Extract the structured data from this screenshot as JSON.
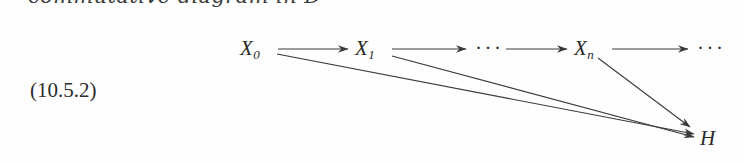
{
  "page": {
    "width": 744,
    "height": 163,
    "background": "#fefefe",
    "ink_color": "#2b2b2b"
  },
  "caption": {
    "text": "commutative diagram in D",
    "style": "italic",
    "note": "clipped by top edge of screenshot"
  },
  "equation": {
    "tag": "(10.5.2)"
  },
  "diagram": {
    "nodes": [
      {
        "id": "x0",
        "base": "X",
        "sub": "0",
        "x": 240,
        "y": 36
      },
      {
        "id": "x1",
        "base": "X",
        "sub": "1",
        "x": 355,
        "y": 36
      },
      {
        "id": "xn",
        "base": "X",
        "sub": "n",
        "x": 574,
        "y": 36
      },
      {
        "id": "h",
        "base": "H",
        "sub": "",
        "x": 700,
        "y": 126
      }
    ],
    "ellipses": [
      {
        "id": "mid-ellipsis",
        "text": "···",
        "x": 475,
        "y": 36
      },
      {
        "id": "tail-ellipsis",
        "text": "···",
        "x": 697,
        "y": 36
      }
    ],
    "horizontal_arrows": [
      {
        "from": "x0",
        "to": "x1",
        "x1": 278,
        "x2": 348,
        "y": 49
      },
      {
        "from": "x1",
        "to": "mid-ellipsis",
        "x1": 392,
        "x2": 466,
        "y": 49
      },
      {
        "from": "mid-ellipsis",
        "to": "xn",
        "x1": 506,
        "x2": 567,
        "y": 49
      },
      {
        "from": "xn",
        "to": "tail-ellipsis",
        "x1": 612,
        "x2": 688,
        "y": 49
      }
    ],
    "diagonal_arrows": [
      {
        "from": "x0",
        "to": "h",
        "x1": 277,
        "y1": 54,
        "x2": 694,
        "y2": 134
      },
      {
        "from": "x1",
        "to": "h",
        "x1": 392,
        "y1": 56,
        "x2": 694,
        "y2": 137
      },
      {
        "from": "xn",
        "to": "h",
        "x1": 598,
        "y1": 58,
        "x2": 690,
        "y2": 127
      }
    ]
  }
}
